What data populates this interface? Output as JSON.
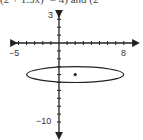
{
  "caption": "(2 + 1.5x)² = 4) and (2",
  "chart_data": {
    "type": "scatter",
    "title": "",
    "xlabel": "",
    "ylabel": "",
    "xlim": [
      -5,
      8
    ],
    "ylim": [
      -10,
      3
    ],
    "tick_labels": {
      "x_min": "−5",
      "x_max": "8",
      "y_max": "3",
      "y_min": "−10"
    },
    "shapes": [
      {
        "type": "ellipse",
        "center": [
          2,
          -4
        ],
        "semi_x": 6,
        "semi_y": 1
      }
    ],
    "points": [
      {
        "x": 2,
        "y": -4
      }
    ],
    "grid": false,
    "legend": null
  }
}
